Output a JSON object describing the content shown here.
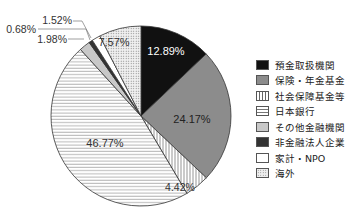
{
  "chart_data": {
    "type": "pie",
    "title": "",
    "start_angle_deg": 0,
    "direction": "clockwise",
    "slices": [
      {
        "label": "預金取扱機関",
        "value": 12.89,
        "value_label": "12.89%",
        "fill": "#111111",
        "pattern": "solid",
        "label_color": "#ffffff"
      },
      {
        "label": "保険・年金基金",
        "value": 24.17,
        "value_label": "24.17%",
        "fill": "#8c8c8c",
        "pattern": "solid",
        "label_color": "#222222"
      },
      {
        "label": "社会保障基金等",
        "value": 4.42,
        "value_label": "4.42%",
        "fill": "#ffffff",
        "pattern": "vertical-lines",
        "label_color": "#333333"
      },
      {
        "label": "日本銀行",
        "value": 46.77,
        "value_label": "46.77%",
        "fill": "#ffffff",
        "pattern": "horizontal-lines",
        "label_color": "#333333"
      },
      {
        "label": "その他金融機関",
        "value": 1.98,
        "value_label": "1.98%",
        "fill": "#c8c8c8",
        "pattern": "solid",
        "label_color": "#333333"
      },
      {
        "label": "非金融法人企業",
        "value": 0.68,
        "value_label": "0.68%",
        "fill": "#333333",
        "pattern": "solid",
        "label_color": "#333333"
      },
      {
        "label": "家計・NPO",
        "value": 1.52,
        "value_label": "1.52%",
        "fill": "#ffffff",
        "pattern": "solid",
        "label_color": "#333333"
      },
      {
        "label": "海外",
        "value": 7.57,
        "value_label": "7.57%",
        "fill": "#e6e6e6",
        "pattern": "dots",
        "label_color": "#333333"
      }
    ],
    "legend_position": "right",
    "legend": [
      "預金取扱機関",
      "保険・年金基金",
      "社会保障基金等",
      "日本銀行",
      "その他金融機関",
      "非金融法人企業",
      "家計・NPO",
      "海外"
    ]
  },
  "legend": {
    "items": [
      {
        "label": "預金取扱機関"
      },
      {
        "label": "保険・年金基金"
      },
      {
        "label": "社会保障基金等"
      },
      {
        "label": "日本銀行"
      },
      {
        "label": "その他金融機関"
      },
      {
        "label": "非金融法人企業"
      },
      {
        "label": "家計・NPO"
      },
      {
        "label": "海外"
      }
    ]
  },
  "labels": {
    "s0": "12.89%",
    "s1": "24.17%",
    "s2": "4.42%",
    "s3": "46.77%",
    "s4": "1.98%",
    "s5": "0.68%",
    "s6": "1.52%",
    "s7": "7.57%"
  }
}
